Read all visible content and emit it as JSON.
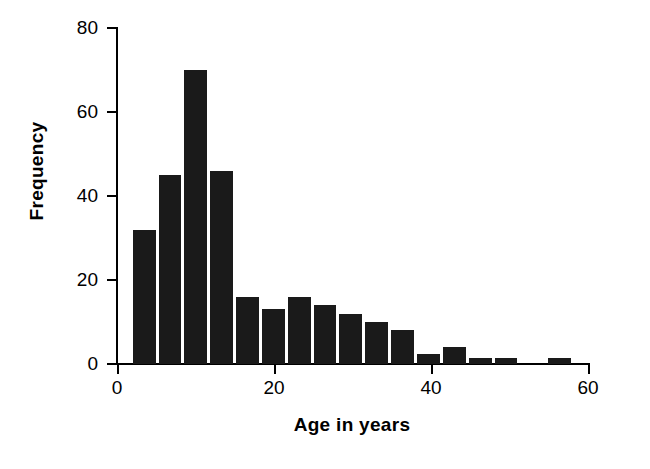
{
  "chart_data": {
    "type": "bar",
    "title": "",
    "subtitle": "",
    "xlabel": "Age in years",
    "ylabel": "Frequency",
    "xlim": [
      0,
      60
    ],
    "ylim": [
      0,
      80
    ],
    "xticks": [
      0,
      20,
      40,
      60
    ],
    "xtick_labels": [
      "0",
      "20",
      "40",
      "60"
    ],
    "yticks": [
      0,
      20,
      40,
      60,
      80
    ],
    "ytick_labels": [
      "0",
      "20",
      "40",
      "60",
      "80"
    ],
    "grid": false,
    "legend": null,
    "bar_color": "#1a1a1a",
    "bin_width": 3.3,
    "bin_starts": [
      2.0,
      5.3,
      8.6,
      11.9,
      15.2,
      18.5,
      21.8,
      25.1,
      28.4,
      31.7,
      35.0,
      38.3,
      41.6,
      44.9,
      48.2,
      55.0
    ],
    "bin_labels": [
      "2.0–5.3",
      "5.3–8.6",
      "8.6–11.9",
      "11.9–15.2",
      "15.2–18.5",
      "18.5–21.8",
      "21.8–25.1",
      "25.1–28.4",
      "28.4–31.7",
      "31.7–35.0",
      "35.0–38.3",
      "38.3–41.6",
      "41.6–44.9",
      "44.9–48.2",
      "48.2–51.5",
      "55.0–58.3"
    ],
    "categories": [
      "2.0",
      "5.3",
      "8.6",
      "11.9",
      "15.2",
      "18.5",
      "21.8",
      "25.1",
      "28.4",
      "31.7",
      "35.0",
      "38.3",
      "41.6",
      "44.9",
      "48.2",
      "55.0"
    ],
    "values": [
      32,
      45,
      70,
      46,
      16,
      13,
      16,
      14,
      12,
      10,
      8,
      2.5,
      4,
      1.5,
      1.5,
      1.5
    ]
  }
}
